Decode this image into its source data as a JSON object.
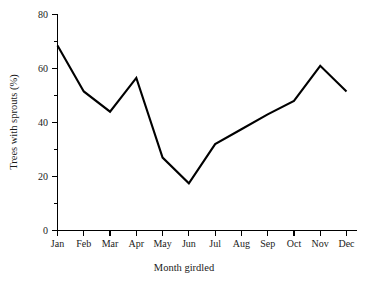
{
  "chart_data": {
    "type": "line",
    "title": "",
    "subtitle": "",
    "xlabel": "Month girdled",
    "ylabel": "Trees with sprouts (%)",
    "categories": [
      "Jan",
      "Feb",
      "Mar",
      "Apr",
      "May",
      "Jun",
      "Jul",
      "Aug",
      "Sep",
      "Oct",
      "Nov",
      "Dec"
    ],
    "values": [
      68.5,
      51.5,
      44.0,
      56.5,
      27.0,
      17.5,
      32.0,
      37.5,
      43.0,
      48.0,
      61.0,
      51.5
    ],
    "series": [
      {
        "name": "Trees with sprouts (%)",
        "values": [
          68.5,
          51.5,
          44.0,
          56.5,
          27.0,
          17.5,
          32.0,
          37.5,
          43.0,
          48.0,
          61.0,
          51.5
        ]
      }
    ],
    "ylim": [
      0,
      80
    ],
    "y_major_ticks": [
      0,
      20,
      40,
      60,
      80
    ],
    "y_major_tick_labels": [
      "0",
      "20",
      "40",
      "60",
      "80"
    ],
    "y_minor_ticks": [
      10,
      30,
      50,
      70
    ],
    "x_tick_labels": [
      "Jan",
      "Feb",
      "Mar",
      "Apr",
      "May",
      "Jun",
      "Jul",
      "Aug",
      "Sep",
      "Oct",
      "Nov",
      "Dec"
    ],
    "grid": false,
    "legend": false,
    "legend_position": "none",
    "line_color": "#000000",
    "background_color": "#ffffff",
    "axis_color": "#000000"
  }
}
